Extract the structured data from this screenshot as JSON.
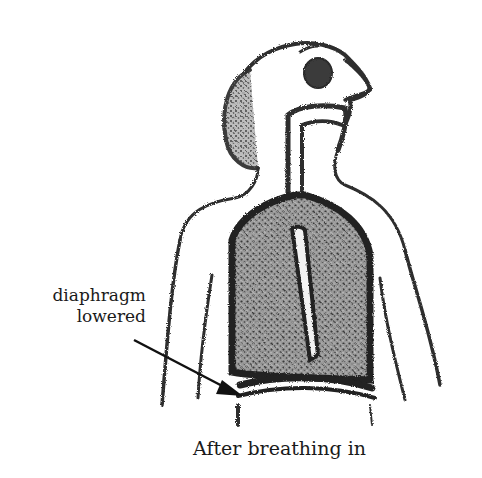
{
  "figure": {
    "title": "",
    "annotation": {
      "line1": "diaphragm",
      "line2": "lowered",
      "pointer": "arrow-icon"
    },
    "caption": "After breathing in",
    "ink_color": "#2a2a2a",
    "background": "#ffffff",
    "parts": [
      "head",
      "eye",
      "nose",
      "airway",
      "trachea",
      "lungs",
      "diaphragm",
      "shoulders",
      "arms",
      "rib-sides"
    ]
  }
}
